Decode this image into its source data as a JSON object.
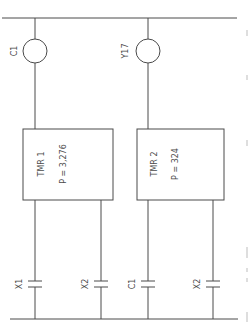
{
  "diagram": {
    "type": "ladder-logic",
    "rails": {
      "top": {
        "y": 18,
        "x1": 2,
        "x2": 237
      },
      "bottom": {
        "y": 319,
        "x1": 10,
        "x2": 238
      }
    },
    "coils": [
      {
        "label": "C1",
        "cx": 35,
        "cy": 51
      },
      {
        "label": "Y17",
        "cx": 148,
        "cy": 51
      }
    ],
    "timers": [
      {
        "name": "TMR 1",
        "preset": "P = 3,276",
        "x": 23,
        "y": 29,
        "w": 90,
        "h": 71
      },
      {
        "name": "TMR 2",
        "preset": "P = 324",
        "x": 137,
        "y": 29,
        "w": 87,
        "h": 71
      }
    ],
    "contacts": [
      {
        "label": "X1",
        "x": 35
      },
      {
        "label": "X2",
        "x": 101
      },
      {
        "label": "C1",
        "x": 148
      },
      {
        "label": "X2",
        "x": 213
      }
    ]
  }
}
